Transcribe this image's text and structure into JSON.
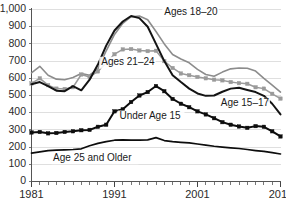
{
  "chart_data": {
    "type": "line",
    "title": "",
    "subtitle": "",
    "xlabel": "",
    "ylabel": "",
    "xlim": [
      1981,
      2011
    ],
    "ylim": [
      0,
      1000
    ],
    "grid": true,
    "legend_position": "inline-annotations",
    "x": [
      1981,
      1982,
      1983,
      1984,
      1985,
      1986,
      1987,
      1988,
      1989,
      1990,
      1991,
      1992,
      1993,
      1994,
      1995,
      1996,
      1997,
      1998,
      1999,
      2000,
      2001,
      2002,
      2003,
      2004,
      2005,
      2006,
      2007,
      2008,
      2009,
      2010,
      2011
    ],
    "y_ticks": [
      0,
      100,
      200,
      300,
      400,
      500,
      600,
      700,
      800,
      900,
      1000
    ],
    "y_tick_labels": [
      "0",
      "100",
      "200",
      "300",
      "400",
      "500",
      "600",
      "700",
      "800",
      "900",
      "1,000"
    ],
    "x_ticks_major": [
      1981,
      1991,
      2001,
      2011
    ],
    "x_tick_labels_major": [
      "1981",
      "1991",
      "2001",
      "2011"
    ],
    "series": [
      {
        "name": "Ages 18–20",
        "label": "Ages 18–20",
        "color": "#8c8c8c",
        "marker": "none",
        "width": 1.6,
        "values": [
          632,
          670,
          618,
          595,
          592,
          605,
          628,
          618,
          655,
          760,
          855,
          920,
          958,
          962,
          940,
          872,
          800,
          738,
          712,
          690,
          652,
          622,
          612,
          636,
          655,
          660,
          658,
          642,
          600,
          560,
          520
        ]
      },
      {
        "name": "Ages 21–24",
        "label": "Ages 21–24",
        "color": "#9a9a9a",
        "marker": "square",
        "width": 1.5,
        "values": [
          570,
          600,
          560,
          540,
          538,
          548,
          622,
          608,
          640,
          690,
          740,
          768,
          770,
          762,
          758,
          760,
          700,
          660,
          628,
          618,
          608,
          600,
          592,
          588,
          578,
          572,
          568,
          548,
          540,
          510,
          482
        ]
      },
      {
        "name": "Age 15–17",
        "label": "Age 15–17",
        "color": "#141414",
        "marker": "none",
        "width": 2.0,
        "values": [
          565,
          578,
          555,
          528,
          525,
          555,
          530,
          592,
          680,
          790,
          878,
          930,
          962,
          950,
          900,
          800,
          700,
          618,
          578,
          540,
          512,
          498,
          500,
          522,
          540,
          545,
          532,
          520,
          498,
          452,
          390
        ]
      },
      {
        "name": "Under Age 15",
        "label": "Under Age 15",
        "color": "#0d0d0d",
        "marker": "square",
        "width": 2.0,
        "values": [
          285,
          288,
          280,
          282,
          288,
          292,
          298,
          300,
          318,
          330,
          408,
          420,
          462,
          500,
          520,
          555,
          525,
          480,
          452,
          432,
          408,
          390,
          368,
          345,
          330,
          320,
          312,
          322,
          318,
          292,
          262
        ]
      },
      {
        "name": "Age 25 and Older",
        "label": "Age 25 and Older",
        "color": "#0d0d0d",
        "marker": "none",
        "width": 1.7,
        "values": [
          165,
          172,
          180,
          182,
          184,
          186,
          190,
          208,
          222,
          232,
          240,
          242,
          240,
          240,
          242,
          255,
          238,
          232,
          228,
          225,
          218,
          212,
          205,
          200,
          196,
          192,
          186,
          180,
          175,
          168,
          160
        ]
      }
    ],
    "annotations": [
      {
        "text": "Ages 18–20",
        "x": 1997.0,
        "y": 985,
        "anchor": "start"
      },
      {
        "text": "Ages 21–24",
        "x": 1989.4,
        "y": 690,
        "anchor": "start"
      },
      {
        "text": "Age 15–17",
        "x": 2003.8,
        "y": 452,
        "anchor": "start"
      },
      {
        "text": "Under Age 15",
        "x": 1991.6,
        "y": 378,
        "anchor": "start"
      },
      {
        "text": "Age 25 and Older",
        "x": 1983.6,
        "y": 135,
        "anchor": "start"
      }
    ]
  }
}
